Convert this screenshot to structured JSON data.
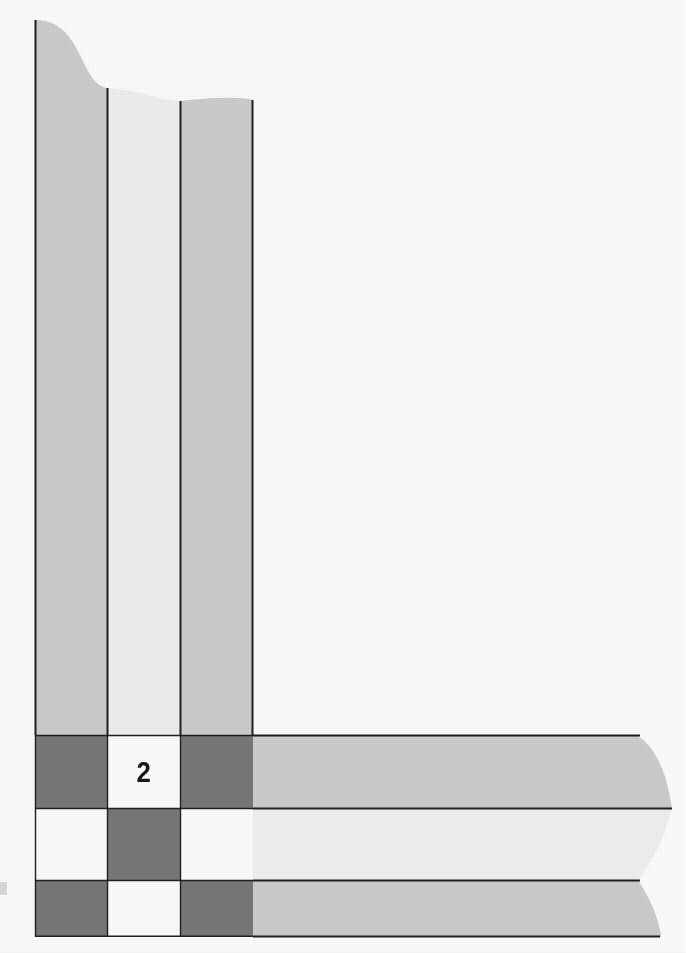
{
  "figure": {
    "title": "",
    "kind": "scanned-diagram",
    "background_color": "#ffffff",
    "canvas": {
      "width": 686,
      "height": 953
    }
  },
  "palette": {
    "paper_white": "#ffffff",
    "cell_white": "#ffffff",
    "light_gray": "#cfcfcf",
    "pale_gray": "#f1f1f1",
    "dark_gray": "#797979",
    "band_gray": "#cfcfcf",
    "band_pale": "#f3f3f3",
    "rule_black": "#1a1a1a",
    "label_black": "#17181a"
  },
  "vertical_bars": [
    {
      "name": "bar-1",
      "fill": "#cfcfcf",
      "x": 35,
      "width": 72,
      "top_y": 20,
      "bottom_y": 735,
      "top_edge": "s-curve-falling"
    },
    {
      "name": "bar-2",
      "fill": "#f1f1f1",
      "x": 107,
      "width": 73,
      "top_y": 88,
      "bottom_y": 735,
      "top_edge": "gentle-wave"
    },
    {
      "name": "bar-3",
      "fill": "#cfcfcf",
      "x": 180,
      "width": 73,
      "top_y": 100,
      "bottom_y": 735,
      "top_edge": "gentle-wave"
    }
  ],
  "horizontal_bands": [
    {
      "name": "band-1",
      "fill": "#cfcfcf",
      "y": 735,
      "height": 73,
      "left_x": 253,
      "right_x": 648,
      "right_edge": "s-curve-flaring"
    },
    {
      "name": "band-2",
      "fill": "#f3f3f3",
      "y": 808,
      "height": 72,
      "left_x": 253,
      "right_x": 672,
      "right_edge": "gentle-wave"
    },
    {
      "name": "band-3",
      "fill": "#cfcfcf",
      "y": 880,
      "height": 57,
      "left_x": 253,
      "right_x": 648,
      "right_edge": "s-curve-flaring"
    }
  ],
  "grid": {
    "name": "checkerboard",
    "origin_x": 35,
    "origin_y": 735,
    "col_edges": [
      35,
      107,
      180,
      253
    ],
    "row_edges": [
      735,
      808,
      880,
      937
    ],
    "rows": 3,
    "cols": 3,
    "cells": [
      [
        {
          "id": "r1c1",
          "shade": "dark",
          "fill": "#797979",
          "label": ""
        },
        {
          "id": "r1c2",
          "shade": "white",
          "fill": "#ffffff",
          "label": "2"
        },
        {
          "id": "r1c3",
          "shade": "dark",
          "fill": "#797979",
          "label": ""
        }
      ],
      [
        {
          "id": "r2c1",
          "shade": "white",
          "fill": "#ffffff",
          "label": ""
        },
        {
          "id": "r2c2",
          "shade": "dark",
          "fill": "#797979",
          "label": ""
        },
        {
          "id": "r2c3",
          "shade": "white",
          "fill": "#ffffff",
          "label": ""
        }
      ],
      [
        {
          "id": "r3c1",
          "shade": "dark",
          "fill": "#797979",
          "label": ""
        },
        {
          "id": "r3c2",
          "shade": "white",
          "fill": "#ffffff",
          "label": ""
        },
        {
          "id": "r3c3",
          "shade": "dark",
          "fill": "#797979",
          "label": ""
        }
      ]
    ]
  },
  "labels": [
    {
      "name": "grid-cell-value",
      "text": "2",
      "x": 107,
      "y": 735,
      "width": 73,
      "height": 73
    }
  ],
  "artifacts": [
    {
      "name": "scan-speck-left-margin",
      "x": 0,
      "y": 882,
      "width": 7,
      "height": 13
    }
  ]
}
